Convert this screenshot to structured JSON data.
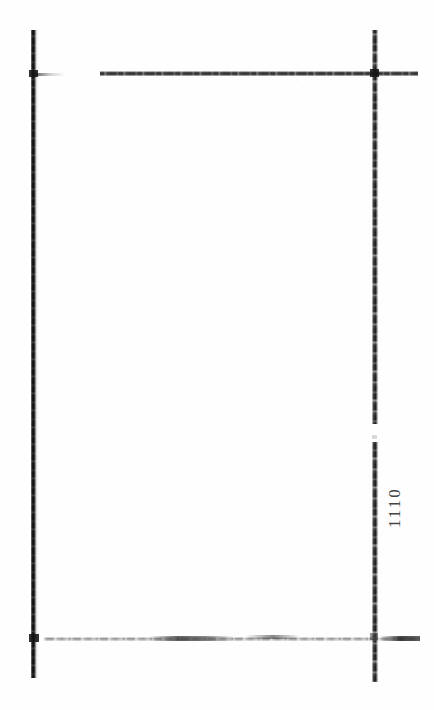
{
  "document": {
    "type": "scanned-page",
    "page_state": "blank",
    "background_color": "#ffffff",
    "ink_color": "#1a1a1a",
    "width": 434,
    "height": 710
  },
  "margin": {
    "page_number": "1110",
    "page_number_orientation": "rotated-90-ccw",
    "page_number_position": "right-margin"
  },
  "frame": {
    "left_rule_label": "left vertical rule",
    "right_rule_label": "right vertical rule",
    "top_rule_label": "top horizontal rule",
    "bottom_rule_label": "bottom horizontal rule"
  },
  "content": {
    "body_text": ""
  }
}
